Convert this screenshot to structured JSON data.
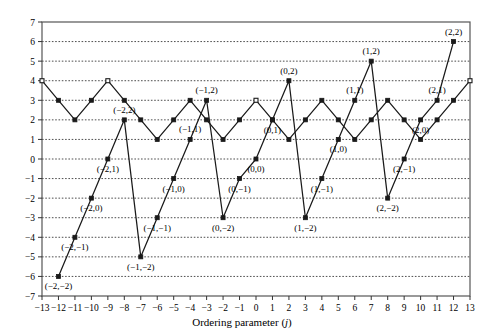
{
  "chart_data": {
    "type": "line",
    "title": "",
    "xlabel": "Ordering parameter (j)",
    "ylabel": "Integer wavenumber (lj)",
    "xlim": [
      -13,
      13
    ],
    "ylim": [
      -7,
      7
    ],
    "xticks": [
      -13,
      -12,
      -11,
      -10,
      -9,
      -8,
      -7,
      -6,
      -5,
      -4,
      -3,
      -2,
      -1,
      0,
      1,
      2,
      3,
      4,
      5,
      6,
      7,
      8,
      9,
      10,
      11,
      12,
      13
    ],
    "yticks": [
      -7,
      -6,
      -5,
      -4,
      -3,
      -2,
      -1,
      0,
      1,
      2,
      3,
      4,
      5,
      6,
      7
    ],
    "grid": "horizontal-dotted",
    "legend": "none",
    "series": [
      {
        "name": "zigzag-upper",
        "marker": "square",
        "points": [
          {
            "x": -13,
            "y": 4,
            "fill": "open"
          },
          {
            "x": -12,
            "y": 3,
            "fill": "filled"
          },
          {
            "x": -11,
            "y": 2,
            "fill": "filled"
          },
          {
            "x": -10,
            "y": 3,
            "fill": "filled"
          },
          {
            "x": -9,
            "y": 4,
            "fill": "open"
          },
          {
            "x": -8,
            "y": 3,
            "fill": "filled"
          },
          {
            "x": -7,
            "y": 2,
            "fill": "filled"
          },
          {
            "x": -6,
            "y": 1,
            "fill": "filled"
          },
          {
            "x": -5,
            "y": 2,
            "fill": "filled"
          },
          {
            "x": -4,
            "y": 3,
            "fill": "filled"
          },
          {
            "x": -3,
            "y": 2,
            "fill": "filled"
          },
          {
            "x": -2,
            "y": 1,
            "fill": "filled"
          },
          {
            "x": -1,
            "y": 2,
            "fill": "filled"
          },
          {
            "x": 0,
            "y": 3,
            "fill": "open"
          },
          {
            "x": 1,
            "y": 2,
            "fill": "filled"
          },
          {
            "x": 2,
            "y": 1,
            "fill": "filled"
          },
          {
            "x": 3,
            "y": 2,
            "fill": "filled"
          },
          {
            "x": 4,
            "y": 3,
            "fill": "filled"
          },
          {
            "x": 5,
            "y": 2,
            "fill": "filled"
          },
          {
            "x": 6,
            "y": 1,
            "fill": "filled"
          },
          {
            "x": 7,
            "y": 2,
            "fill": "filled"
          },
          {
            "x": 8,
            "y": 3,
            "fill": "filled"
          },
          {
            "x": 9,
            "y": 2,
            "fill": "filled"
          },
          {
            "x": 10,
            "y": 1,
            "fill": "filled"
          },
          {
            "x": 11,
            "y": 2,
            "fill": "filled"
          },
          {
            "x": 12,
            "y": 3,
            "fill": "filled"
          },
          {
            "x": 13,
            "y": 4,
            "fill": "open"
          }
        ]
      },
      {
        "name": "sawtooth-lower",
        "marker": "square-filled",
        "points": [
          {
            "x": -12,
            "y": -6,
            "label": "(-2,-2)",
            "lpos": "below"
          },
          {
            "x": -11,
            "y": -4,
            "label": "(-2,-1)",
            "lpos": "below"
          },
          {
            "x": -10,
            "y": -2,
            "label": "(-2,0)",
            "lpos": "below"
          },
          {
            "x": -9,
            "y": 0,
            "label": "(-2,1)",
            "lpos": "below"
          },
          {
            "x": -8,
            "y": 2,
            "label": "(-2,2)",
            "lpos": "above"
          },
          {
            "x": -7,
            "y": -5,
            "label": "(-1,-2)",
            "lpos": "below"
          },
          {
            "x": -6,
            "y": -3,
            "label": "(-1,-1)",
            "lpos": "below"
          },
          {
            "x": -5,
            "y": -1,
            "label": "(-1,0)",
            "lpos": "below"
          },
          {
            "x": -4,
            "y": 1,
            "label": "(-1,1)",
            "lpos": "above"
          },
          {
            "x": -3,
            "y": 3,
            "label": "(-1,2)",
            "lpos": "above"
          },
          {
            "x": -2,
            "y": -3,
            "label": "(0,-2)",
            "lpos": "below"
          },
          {
            "x": -1,
            "y": -1,
            "label": "(0,-1)",
            "lpos": "below"
          },
          {
            "x": 0,
            "y": 0,
            "label": "(0,0)",
            "lpos": "below"
          },
          {
            "x": 1,
            "y": 2,
            "label": "(0,1)",
            "lpos": "below"
          },
          {
            "x": 2,
            "y": 4,
            "label": "(0,2)",
            "lpos": "above"
          },
          {
            "x": 3,
            "y": -3,
            "label": "(1,-2)",
            "lpos": "below"
          },
          {
            "x": 4,
            "y": -1,
            "label": "(1,-1)",
            "lpos": "below"
          },
          {
            "x": 5,
            "y": 1,
            "label": "(1,0)",
            "lpos": "below"
          },
          {
            "x": 6,
            "y": 3,
            "label": "(1,1)",
            "lpos": "above"
          },
          {
            "x": 7,
            "y": 5,
            "label": "(1,2)",
            "lpos": "above"
          },
          {
            "x": 8,
            "y": -2,
            "label": "(2,-2)",
            "lpos": "below"
          },
          {
            "x": 9,
            "y": 0,
            "label": "(2,-1)",
            "lpos": "below"
          },
          {
            "x": 10,
            "y": 2,
            "label": "(2,0)",
            "lpos": "below"
          },
          {
            "x": 11,
            "y": 3,
            "label": "(2,1)",
            "lpos": "above"
          },
          {
            "x": 12,
            "y": 6,
            "label": "(2,2)",
            "lpos": "above"
          }
        ]
      }
    ],
    "style": {
      "line_color": "#1a1a1a",
      "grid_color": "#3a3a3a",
      "frame_color": "#555555",
      "background": "#ffffff"
    }
  }
}
